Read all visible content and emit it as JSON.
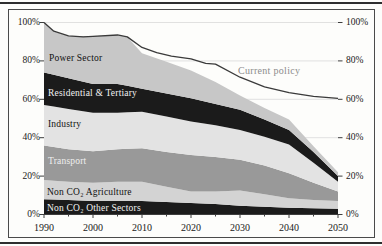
{
  "figure": {
    "kind": "stacked-area-chart"
  },
  "chart_data": {
    "type": "area",
    "stacked": true,
    "x_range": [
      1990,
      2050
    ],
    "y_range": [
      0,
      100
    ],
    "y_unit": "%",
    "grid": "horizontal-light",
    "x_ticks": [
      "1990",
      "2000",
      "2010",
      "2020",
      "2030",
      "2040",
      "2050"
    ],
    "y_ticks": [
      "0%",
      "20%",
      "40%",
      "60%",
      "80%",
      "100%"
    ],
    "years": [
      1990,
      1992,
      1995,
      2000,
      2005,
      2007,
      2010,
      2015,
      2020,
      2025,
      2030,
      2035,
      2040,
      2045,
      2050
    ],
    "series": [
      {
        "name": "Non CO₂ Other Sectors",
        "color": "#1b1b1b",
        "values": [
          8,
          7.8,
          7.5,
          7,
          7,
          7,
          7,
          6.5,
          6,
          5.5,
          4.5,
          4,
          3.5,
          3.2,
          3
        ]
      },
      {
        "name": "Non CO₂ Agriculture",
        "color": "#d3d3d3",
        "values": [
          10,
          9.8,
          9.5,
          9.5,
          10,
          10,
          10,
          8,
          6,
          6.5,
          8,
          6.5,
          5,
          4.3,
          4
        ]
      },
      {
        "name": "Transport",
        "color": "#999999",
        "values": [
          18,
          17.6,
          17,
          16.5,
          17,
          17.2,
          17.5,
          18,
          19,
          18,
          16,
          15,
          13,
          9,
          5
        ]
      },
      {
        "name": "Industry",
        "color": "#e3e3e3",
        "values": [
          21,
          21,
          21,
          20,
          19,
          19,
          19,
          18.5,
          17.5,
          16.5,
          15.5,
          15,
          15,
          10.5,
          5
        ]
      },
      {
        "name": "Residential & Tertiary",
        "color": "#1b1b1b",
        "values": [
          17,
          16.6,
          16,
          15,
          15,
          13.8,
          12,
          12,
          12,
          11,
          10.5,
          9,
          7.5,
          5.5,
          3
        ]
      },
      {
        "name": "Power Sector",
        "color": "#c7c7c7",
        "values": [
          26,
          22.7,
          22,
          25,
          25.5,
          25.5,
          18.5,
          16.5,
          14.5,
          11.5,
          7.5,
          6,
          5.5,
          3,
          2
        ]
      }
    ],
    "line": {
      "name": "Current policy",
      "color": "#3a3a3a",
      "points": [
        [
          1990,
          100
        ],
        [
          1992,
          95.5
        ],
        [
          1995,
          93
        ],
        [
          1998,
          92.5
        ],
        [
          2000,
          92.8
        ],
        [
          2005,
          93.5
        ],
        [
          2007,
          92.5
        ],
        [
          2010,
          87
        ],
        [
          2013,
          84.3
        ],
        [
          2016,
          82.5
        ],
        [
          2020,
          81
        ],
        [
          2023,
          78.7
        ],
        [
          2025,
          78.3
        ],
        [
          2030,
          71.5
        ],
        [
          2035,
          66.5
        ],
        [
          2040,
          63.5
        ],
        [
          2045,
          61.5
        ],
        [
          2050,
          60.5
        ]
      ]
    },
    "annotations": [
      {
        "id": "power-sector-label",
        "text": "Power Sector",
        "x": 40,
        "y": 43,
        "color": "#111111",
        "cls": ""
      },
      {
        "id": "residential-label",
        "text": "Residential & Tertiary",
        "x": 39,
        "y": 78,
        "color": "#f2f2f2",
        "cls": ""
      },
      {
        "id": "industry-label",
        "text": "Industry",
        "x": 39,
        "y": 109,
        "color": "#111111",
        "cls": ""
      },
      {
        "id": "transport-label",
        "text": "Transport",
        "x": 39,
        "y": 146,
        "color": "#efefef",
        "cls": ""
      },
      {
        "id": "non-co2-agriculture-label",
        "text": "Non CO₂ Agriculture",
        "x": 38,
        "y": 177,
        "color": "#111111",
        "cls": ""
      },
      {
        "id": "non-co2-other-label",
        "text": "Non CO₂ Other Sectors",
        "x": 38,
        "y": 193,
        "color": "#f2f2f2",
        "cls": ""
      },
      {
        "id": "current-policy-label",
        "text": "Current policy",
        "x": 229,
        "y": 56,
        "color": "#8c8c8c",
        "cls": "cplab"
      }
    ],
    "axis_color": "#3d3d3d",
    "gridline_color": "#d9d9d9"
  }
}
